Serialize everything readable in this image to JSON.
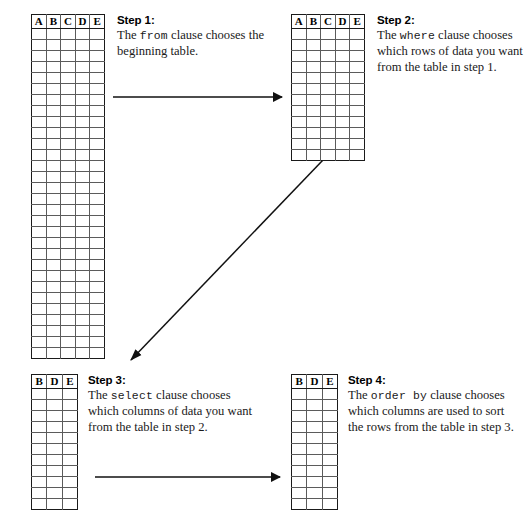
{
  "diagram": {
    "line_color": "#1a1a1a",
    "grid_color": "#5b5b5b"
  },
  "steps": [
    {
      "id": "step1",
      "title": "Step 1:",
      "text_before": "The ",
      "keyword": "from",
      "text_after": " clause chooses the beginning table.",
      "table": {
        "columns": [
          "A",
          "B",
          "C",
          "D",
          "E"
        ],
        "rows": 30
      }
    },
    {
      "id": "step2",
      "title": "Step 2:",
      "text_before": "The ",
      "keyword": "where",
      "text_after": " clause chooses which rows of data you want from the table in step 1.",
      "table": {
        "columns": [
          "A",
          "B",
          "C",
          "D",
          "E"
        ],
        "rows": 12
      }
    },
    {
      "id": "step3",
      "title": "Step 3:",
      "text_before": "The ",
      "keyword": "select",
      "text_after": " clause chooses which columns of data you want from the table in step 2.",
      "table": {
        "columns": [
          "B",
          "D",
          "E"
        ],
        "rows": 11
      }
    },
    {
      "id": "step4",
      "title": "Step 4:",
      "text_before": "The ",
      "keyword": "order by",
      "text_after": " clause chooses which columns are used to sort the rows from the table in step 3.",
      "table": {
        "columns": [
          "B",
          "D",
          "E"
        ],
        "rows": 11
      }
    }
  ],
  "arrows": [
    {
      "name": "arrow-step1-to-step2",
      "from": [
        113,
        97
      ],
      "to": [
        285,
        97
      ]
    },
    {
      "name": "arrow-step2-to-step3",
      "from": [
        323,
        160
      ],
      "to": [
        130,
        361
      ]
    },
    {
      "name": "arrow-step3-to-step4",
      "from": [
        95,
        477
      ],
      "to": [
        283,
        477
      ]
    }
  ]
}
